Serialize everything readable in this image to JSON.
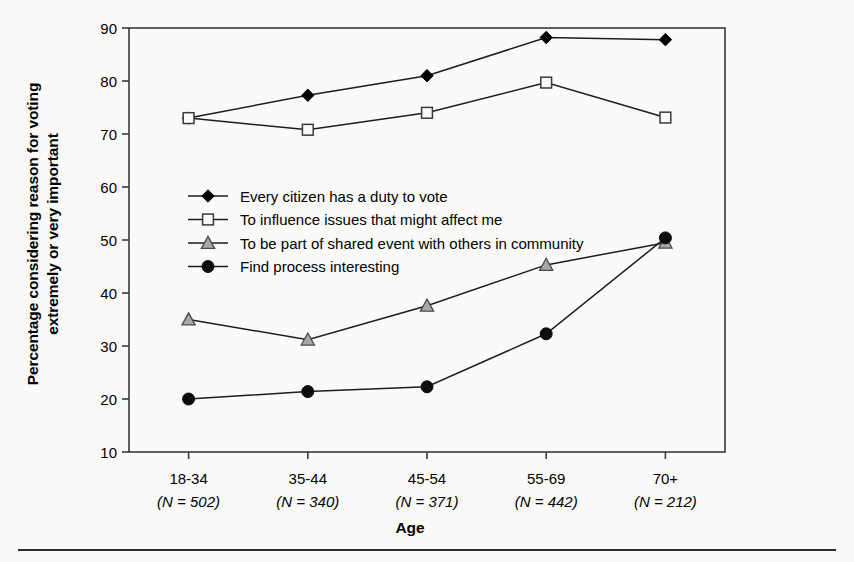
{
  "chart_data": {
    "type": "line",
    "title": "",
    "xlabel": "Age",
    "ylabel": "Percentage considering reason for voting extremely or very important",
    "categories": [
      "18-34",
      "35-44",
      "45-54",
      "55-69",
      "70+"
    ],
    "category_n": [
      "(N = 502)",
      "(N = 340)",
      "(N = 371)",
      "(N = 442)",
      "(N = 212)"
    ],
    "ylim": [
      10,
      90
    ],
    "yticks": [
      10,
      20,
      30,
      40,
      50,
      60,
      70,
      80,
      90
    ],
    "grid": false,
    "legend_position": "inside-upper-left",
    "series": [
      {
        "name": "Every citizen has a duty to vote",
        "marker": "filled-diamond",
        "color": "#000000",
        "values": [
          73.0,
          77.3,
          81.0,
          88.2,
          87.8
        ]
      },
      {
        "name": "To influence issues that might affect me",
        "marker": "open-square",
        "color": "#000000",
        "values": [
          73.0,
          70.8,
          74.0,
          79.7,
          73.1
        ]
      },
      {
        "name": "To be part of shared event with others in community",
        "marker": "grey-triangle",
        "color": "#9a9a9a",
        "values": [
          35.0,
          31.2,
          37.6,
          45.3,
          49.5
        ]
      },
      {
        "name": "Find process interesting",
        "marker": "filled-circle",
        "color": "#000000",
        "values": [
          20.0,
          21.4,
          22.3,
          32.3,
          50.4
        ]
      }
    ]
  },
  "labels": {
    "ylabel_line1": "Percentage considering reason for voting",
    "ylabel_line2": "extremely or very important",
    "xlabel": "Age"
  }
}
